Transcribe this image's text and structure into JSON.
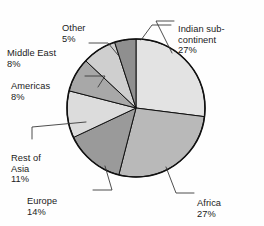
{
  "chart_data": {
    "type": "pie",
    "title": "",
    "subtitle": "",
    "xlabel": "",
    "ylabel": "",
    "legend_position": "none",
    "grid": false,
    "start_angle_deg": 0,
    "direction": "clockwise",
    "categories": [
      "Indian sub-continent",
      "Africa",
      "Europe",
      "Rest of Asia",
      "Americas",
      "Middle East",
      "Other"
    ],
    "values": [
      27,
      27,
      14,
      11,
      8,
      8,
      5
    ],
    "value_unit": "%",
    "slice_colors": [
      "#e3e3e3",
      "#b9b9b9",
      "#9a9a9a",
      "#dcdcdc",
      "#a8a8a8",
      "#cfcfcf",
      "#8f8f8f"
    ],
    "slices": [
      {
        "label": "Indian sub-continent",
        "value": 27,
        "value_text": "27%",
        "color": "#e3e3e3"
      },
      {
        "label": "Africa",
        "value": 27,
        "value_text": "27%",
        "color": "#b9b9b9"
      },
      {
        "label": "Europe",
        "value": 14,
        "value_text": "14%",
        "color": "#9a9a9a"
      },
      {
        "label": "Rest of Asia",
        "value": 11,
        "value_text": "11%",
        "color": "#dcdcdc"
      },
      {
        "label": "Americas",
        "value": 8,
        "value_text": "8%",
        "color": "#a8a8a8"
      },
      {
        "label": "Middle East",
        "value": 8,
        "value_text": "8%",
        "color": "#cfcfcf"
      },
      {
        "label": "Other",
        "value": 5,
        "value_text": "5%",
        "color": "#8f8f8f"
      }
    ],
    "outline_color": "#111111",
    "background_color": "#fefefe"
  },
  "labels": {
    "indian": {
      "name": "Indian sub-\ncontinent",
      "pct": "27%"
    },
    "africa": {
      "name": "Africa",
      "pct": "27%"
    },
    "europe": {
      "name": "Europe",
      "pct": "14%"
    },
    "rest_of_asia": {
      "name": "Rest of\nAsia",
      "pct": "11%"
    },
    "americas": {
      "name": "Americas",
      "pct": "8%"
    },
    "middle_east": {
      "name": "Middle East",
      "pct": "8%"
    },
    "other": {
      "name": "Other",
      "pct": "5%"
    }
  },
  "geometry": {
    "center_x": 136,
    "center_y": 108,
    "radius": 69
  }
}
